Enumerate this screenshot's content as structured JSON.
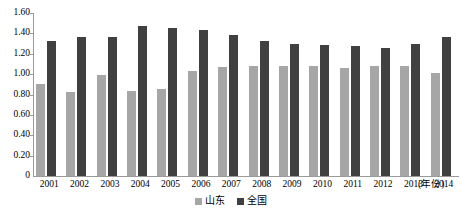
{
  "chart_data": {
    "type": "bar",
    "title": "",
    "subtitle": "",
    "xlabel": "(年份)",
    "ylabel": "",
    "categories": [
      "2001",
      "2002",
      "2003",
      "2004",
      "2005",
      "2006",
      "2007",
      "2008",
      "2009",
      "2010",
      "2011",
      "2012",
      "2013",
      "2014"
    ],
    "series": [
      {
        "name": "山东",
        "color": "#a6a6a6",
        "values": [
          0.9,
          0.82,
          0.99,
          0.83,
          0.85,
          1.03,
          1.07,
          1.08,
          1.08,
          1.08,
          1.06,
          1.08,
          1.08,
          1.01
        ]
      },
      {
        "name": "全国",
        "color": "#404040",
        "values": [
          1.33,
          1.36,
          1.36,
          1.47,
          1.45,
          1.43,
          1.38,
          1.33,
          1.3,
          1.29,
          1.28,
          1.26,
          1.3,
          1.36
        ]
      }
    ],
    "ylim": [
      0,
      1.6
    ],
    "yticks": [
      "0",
      "0.20",
      "0.40",
      "0.60",
      "0.80",
      "1.00",
      "1.20",
      "1.40",
      "1.60"
    ],
    "ytick_values": [
      0,
      0.2,
      0.4,
      0.6,
      0.8,
      1.0,
      1.2,
      1.4,
      1.6
    ],
    "grid": false,
    "legend_position": "bottom-center"
  }
}
